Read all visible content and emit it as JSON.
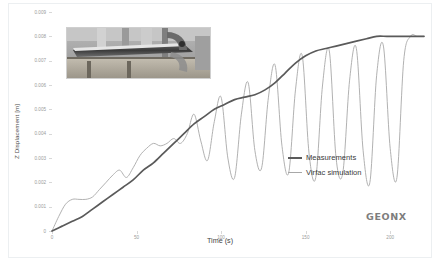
{
  "chart_data": {
    "type": "line",
    "title": "",
    "xlabel": "Time (s)",
    "ylabel": "Z Displacement [m]",
    "xlim": [
      0,
      220
    ],
    "ylim": [
      0,
      0.009
    ],
    "grid": false,
    "legend_position": "center-right",
    "xticks": [
      "0",
      "50",
      "100",
      "150",
      "200"
    ],
    "xtick_values": [
      0,
      50,
      100,
      150,
      200
    ],
    "yticks": [
      "0",
      "0.001",
      "0.002",
      "0.003",
      "0.004",
      "0.005",
      "0.006",
      "0.007",
      "0.008",
      "0.009"
    ],
    "ytick_values": [
      0,
      0.001,
      0.002,
      0.003,
      0.004,
      0.005,
      0.006,
      0.007,
      0.008,
      0.009
    ],
    "series": [
      {
        "name": "Measurements",
        "color": "#5a5a5a",
        "width": 1.7,
        "x": [
          0,
          6,
          12,
          18,
          24,
          30,
          36,
          42,
          48,
          54,
          60,
          66,
          72,
          78,
          84,
          90,
          96,
          102,
          108,
          114,
          120,
          126,
          132,
          138,
          144,
          150,
          156,
          162,
          168,
          174,
          180,
          186,
          192,
          198,
          204,
          210,
          216,
          220
        ],
        "y": [
          0.0,
          0.0002,
          0.0004,
          0.0006,
          0.0009,
          0.0012,
          0.0015,
          0.0018,
          0.0021,
          0.0025,
          0.0028,
          0.0032,
          0.0036,
          0.004,
          0.0044,
          0.0047,
          0.005,
          0.0052,
          0.0054,
          0.0055,
          0.0056,
          0.0058,
          0.0061,
          0.0065,
          0.0069,
          0.0072,
          0.0074,
          0.0075,
          0.0076,
          0.0077,
          0.0078,
          0.0079,
          0.008,
          0.008,
          0.008,
          0.008,
          0.008,
          0.008
        ]
      },
      {
        "name": "Virfac simulation",
        "color": "#a8a8a8",
        "width": 0.9,
        "x": [
          0,
          4,
          8,
          12,
          16,
          20,
          24,
          28,
          32,
          36,
          40,
          44,
          48,
          52,
          56,
          60,
          64,
          68,
          72,
          76,
          80,
          84,
          88,
          92,
          96,
          100,
          104,
          108,
          112,
          116,
          120,
          124,
          128,
          132,
          136,
          140,
          144,
          148,
          152,
          156,
          160,
          164,
          168,
          172,
          176,
          180,
          184,
          188,
          192,
          196,
          200,
          204,
          208,
          212,
          216,
          220
        ],
        "y": [
          0.0,
          0.0006,
          0.0011,
          0.0013,
          0.0013,
          0.0013,
          0.0014,
          0.0017,
          0.002,
          0.0023,
          0.0025,
          0.0022,
          0.0026,
          0.0031,
          0.0034,
          0.0036,
          0.0035,
          0.0036,
          0.0038,
          0.0036,
          0.004,
          0.0048,
          0.0037,
          0.0029,
          0.0045,
          0.0055,
          0.003,
          0.0022,
          0.0048,
          0.0061,
          0.0033,
          0.0026,
          0.0055,
          0.0068,
          0.0035,
          0.0024,
          0.0058,
          0.0072,
          0.0032,
          0.0022,
          0.006,
          0.0074,
          0.003,
          0.0024,
          0.0062,
          0.0075,
          0.0033,
          0.002,
          0.0064,
          0.0076,
          0.0034,
          0.0022,
          0.007,
          0.008,
          0.008,
          0.008
        ]
      }
    ]
  },
  "legend": {
    "items": [
      {
        "label": "Measurements"
      },
      {
        "label": "Virfac simulation"
      }
    ]
  },
  "inset": {
    "name": "welded-beam-specimen-photo",
    "description": "Photograph of a welded metal beam specimen clamped on a test fixture"
  },
  "logo": {
    "text": "GEONX"
  }
}
